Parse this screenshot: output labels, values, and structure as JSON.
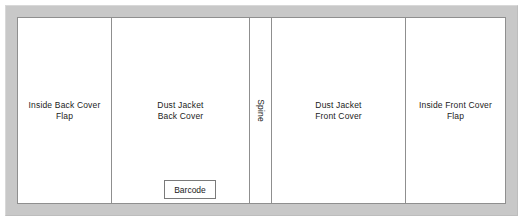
{
  "diagram": {
    "frame_color": "#c8c8c8",
    "panel_border_color": "#8f8f8f",
    "background_color": "#ffffff",
    "text_color": "#1b1b1b",
    "panels": [
      {
        "id": "inside-back-cover-flap",
        "label": "Inside Back Cover\nFlap",
        "orientation": "horizontal"
      },
      {
        "id": "dust-jacket-back-cover",
        "label": "Dust Jacket\nBack Cover",
        "orientation": "horizontal"
      },
      {
        "id": "spine",
        "label": "Spine",
        "orientation": "vertical"
      },
      {
        "id": "dust-jacket-front-cover",
        "label": "Dust Jacket\nFront Cover",
        "orientation": "horizontal"
      },
      {
        "id": "inside-front-cover-flap",
        "label": "Inside Front Cover\nFlap",
        "orientation": "horizontal"
      }
    ],
    "barcode": {
      "label": "Barcode"
    }
  }
}
